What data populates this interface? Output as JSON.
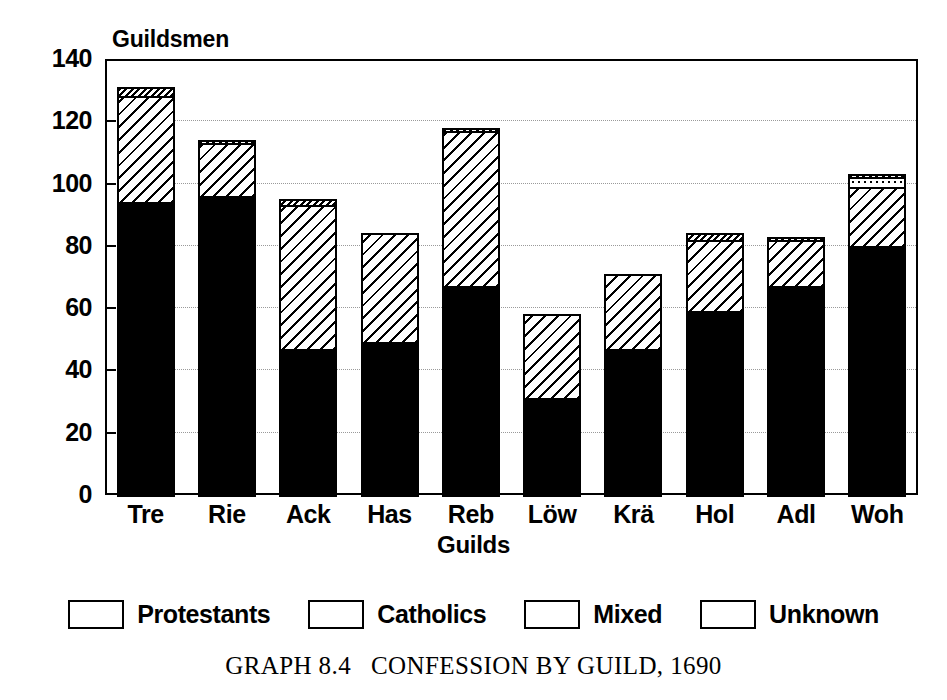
{
  "chart_data": {
    "type": "bar",
    "subtype": "stacked",
    "title": "GRAPH 8.4   CONFESSION BY GUILD, 1690",
    "xlabel": "Guilds",
    "ylabel": "Guildsmen",
    "ylim": [
      0,
      140
    ],
    "yticks": [
      0,
      20,
      40,
      60,
      80,
      100,
      120,
      140
    ],
    "grid": true,
    "grid_axis": "y",
    "legend_position": "below-plot",
    "categories": [
      "Tre",
      "Rie",
      "Ack",
      "Has",
      "Reb",
      "Löw",
      "Krä",
      "Hol",
      "Adl",
      "Woh"
    ],
    "series": [
      {
        "name": "Protestants",
        "fill": "solid-black",
        "color": "#000000",
        "values": [
          94,
          96,
          47,
          49,
          67,
          31,
          47,
          59,
          67,
          80
        ]
      },
      {
        "name": "Catholics",
        "fill": "diagonal-hatch",
        "color": "#000000",
        "values": [
          34,
          17,
          46,
          35,
          50,
          27,
          24,
          23,
          15,
          19
        ]
      },
      {
        "name": "Mixed",
        "fill": "dotted",
        "color": "#000000",
        "values": [
          0,
          0,
          0,
          0,
          0,
          0,
          0,
          0,
          0,
          3
        ]
      },
      {
        "name": "Unknown",
        "fill": "dense-diagonal-hatch",
        "color": "#000000",
        "values": [
          3,
          1,
          2,
          0,
          1,
          0,
          0,
          2,
          1,
          1
        ]
      }
    ],
    "totals": [
      131,
      114,
      95,
      84,
      118,
      58,
      71,
      84,
      83,
      103
    ]
  },
  "axes": {
    "y_title": "Guildsmen",
    "x_title": "Guilds",
    "y_tick_labels": [
      "140",
      "120",
      "100",
      "80",
      "60",
      "40",
      "20",
      "0"
    ],
    "x_tick_labels": [
      "Tre",
      "Rie",
      "Ack",
      "Has",
      "Reb",
      "Löw",
      "Krä",
      "Hol",
      "Adl",
      "Woh"
    ]
  },
  "legend": {
    "items": [
      {
        "label": "Protestants",
        "swatch": "solid-black-swatch"
      },
      {
        "label": "Catholics",
        "swatch": "diagonal-hatch-swatch"
      },
      {
        "label": "Mixed",
        "swatch": "dotted-swatch"
      },
      {
        "label": "Unknown",
        "swatch": "dense-hatch-swatch"
      }
    ]
  },
  "caption": {
    "text": "GRAPH 8.4   CONFESSION BY GUILD, 1690"
  }
}
